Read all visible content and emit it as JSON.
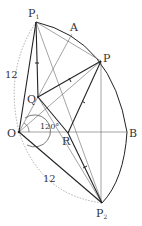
{
  "diagram": {
    "type": "geometry",
    "points": {
      "O": {
        "label": "O",
        "x": 19,
        "y": 132
      },
      "P1": {
        "label": "P",
        "sub": "1",
        "x": 36,
        "y": 22
      },
      "A": {
        "label": "A",
        "x": 72,
        "y": 34
      },
      "P": {
        "label": "P",
        "x": 101,
        "y": 61
      },
      "Q": {
        "label": "Q",
        "x": 38,
        "y": 97
      },
      "R": {
        "label": "R",
        "x": 68,
        "y": 133
      },
      "B": {
        "label": "B",
        "x": 127,
        "y": 132
      },
      "P2": {
        "label": "P",
        "sub": "2",
        "x": 102,
        "y": 203
      }
    },
    "annotations": {
      "length_top": "12",
      "length_bottom": "12",
      "angle": "120°"
    }
  }
}
